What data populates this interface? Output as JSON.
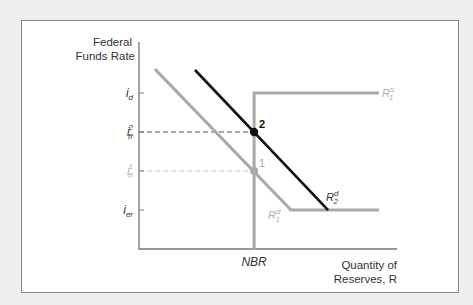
{
  "chart_data": {
    "type": "line",
    "title": "",
    "ylabel": [
      "Federal",
      "Funds Rate"
    ],
    "xlabel": [
      "Quantity of",
      "Reserves, R"
    ],
    "xlim": [
      0,
      10
    ],
    "ylim": [
      0,
      10
    ],
    "grid": false,
    "x_ticks": [
      {
        "name": "NBR",
        "x": 4.46,
        "label": "NBR"
      }
    ],
    "y_ticks": [
      {
        "name": "i-d",
        "y": 8.21,
        "base": "i",
        "sub": "d",
        "sup": "",
        "muted": false
      },
      {
        "name": "i-ff-2",
        "y": 6.16,
        "base": "i",
        "sub": "ff",
        "sup": "2",
        "muted": false
      },
      {
        "name": "i-ff-1",
        "y": 4.11,
        "base": "i",
        "sub": "ff",
        "sup": "1",
        "muted": true
      },
      {
        "name": "i-er",
        "y": 2.05,
        "base": "i",
        "sub": "er",
        "sup": "",
        "muted": false
      }
    ],
    "series": [
      {
        "name": "R1s",
        "label_base": "R",
        "label_sub": "1",
        "label_sup": "s",
        "color": "#a9a9a9",
        "points": [
          [
            4.46,
            0
          ],
          [
            4.46,
            8.21
          ],
          [
            9.3,
            8.21
          ]
        ]
      },
      {
        "name": "R1d",
        "label_base": "R",
        "label_sub": "1",
        "label_sup": "d",
        "color": "#a9a9a9",
        "points": [
          [
            0.62,
            9.47
          ],
          [
            5.89,
            2.05
          ],
          [
            9.3,
            2.05
          ]
        ]
      },
      {
        "name": "R2d",
        "label_base": "R",
        "label_sub": "2",
        "label_sup": "d",
        "color": "#111111",
        "points": [
          [
            2.17,
            9.42
          ],
          [
            7.33,
            2.05
          ]
        ]
      }
    ],
    "equilibria": [
      {
        "label": "1",
        "x": 4.46,
        "y": 4.11,
        "color": "#a9a9a9"
      },
      {
        "label": "2",
        "x": 4.46,
        "y": 6.16,
        "color": "#111111"
      }
    ],
    "dashed_guides": [
      {
        "from_x": 0,
        "to_x": 4.46,
        "y": 6.16,
        "color": "#555555"
      },
      {
        "from_x": 0,
        "to_x": 4.46,
        "y": 4.11,
        "color": "#c4c4c4"
      }
    ]
  }
}
